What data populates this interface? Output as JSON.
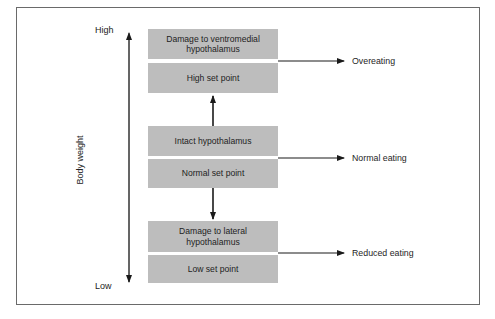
{
  "diagram": {
    "axis": {
      "label": "Body weight",
      "high_label": "High",
      "low_label": "Low"
    },
    "groups": [
      {
        "condition": "Damage to ventromedial hypothalamus",
        "set_point": "High set point",
        "outcome": "Overeating"
      },
      {
        "condition": "Intact hypothalamus",
        "set_point": "Normal set point",
        "outcome": "Normal eating"
      },
      {
        "condition": "Damage to lateral hypothalamus",
        "set_point": "Low set point",
        "outcome": "Reduced eating"
      }
    ],
    "colors": {
      "box_fill": "#bdbdbd",
      "line": "#1a1a1a",
      "frame": "#6a6a6a"
    }
  }
}
